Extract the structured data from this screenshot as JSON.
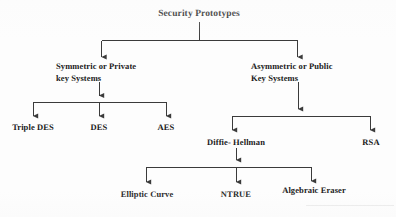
{
  "diagram": {
    "type": "tree",
    "title": "Security Prototypes",
    "root": {
      "id": "security-prototypes",
      "label": "Security Prototypes"
    },
    "nodes": [
      {
        "id": "symmetric",
        "label_line1": "Symmetric or Private",
        "label_line2": "key Systems"
      },
      {
        "id": "asymmetric",
        "label_line1": "Asymmetric or Public",
        "label_line2": "Key Systems"
      },
      {
        "id": "triple-des",
        "label": "Triple DES"
      },
      {
        "id": "des",
        "label": "DES"
      },
      {
        "id": "aes",
        "label": "AES"
      },
      {
        "id": "diffie-hellman",
        "label": "Diffie- Hellman"
      },
      {
        "id": "rsa",
        "label": "RSA"
      },
      {
        "id": "elliptic-curve",
        "label": "Elliptic Curve"
      },
      {
        "id": "ntrue",
        "label": "NTRUE"
      },
      {
        "id": "algebraic-eraser",
        "label": "Algebraic Eraser"
      }
    ],
    "edges": [
      {
        "from": "security-prototypes",
        "to": "symmetric"
      },
      {
        "from": "security-prototypes",
        "to": "asymmetric"
      },
      {
        "from": "symmetric",
        "to": "triple-des"
      },
      {
        "from": "symmetric",
        "to": "des"
      },
      {
        "from": "symmetric",
        "to": "aes"
      },
      {
        "from": "asymmetric",
        "to": "diffie-hellman"
      },
      {
        "from": "asymmetric",
        "to": "rsa"
      },
      {
        "from": "diffie-hellman",
        "to": "elliptic-curve"
      },
      {
        "from": "diffie-hellman",
        "to": "ntrue"
      },
      {
        "from": "diffie-hellman",
        "to": "algebraic-eraser"
      }
    ],
    "colors": {
      "line": "#3b3b3b",
      "text": "#1a1a1a",
      "background": "#fdfdfd"
    }
  }
}
